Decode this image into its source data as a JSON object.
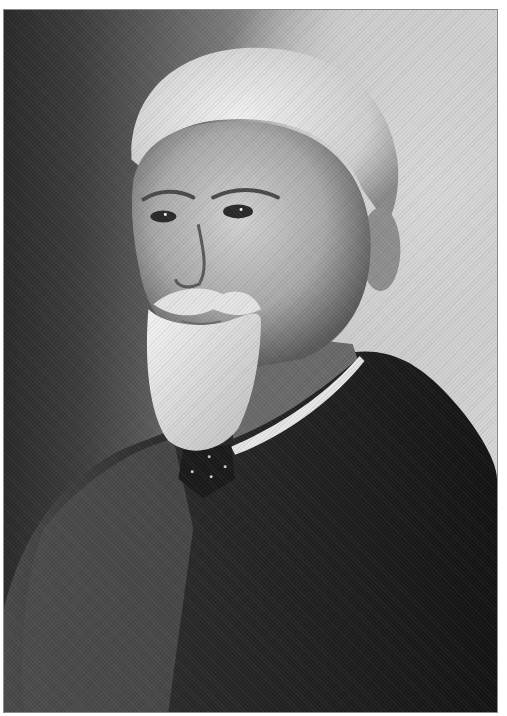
{
  "image": {
    "description": "Black-and-white studio portrait of an elderly man with swept-back white hair, white mustache and full white beard, wearing a dark tweed suit jacket, white collar and dark dotted bow tie, facing left",
    "palette": {
      "background_light": "#d6d6d6",
      "background_dark": "#2a2a2a",
      "hair": "#e2e2e2",
      "skin": "#bdbdbd",
      "beard": "#eeeeee",
      "jacket": "#1c1c1c",
      "border": "#8a8a8a"
    }
  }
}
